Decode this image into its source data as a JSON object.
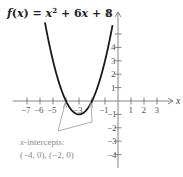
{
  "chart_data": {
    "type": "line",
    "function": "x^2 + 6x + 8",
    "xlabel": "x",
    "ylabel": "y",
    "xlim": [
      -8,
      4
    ],
    "ylim": [
      -5,
      6
    ],
    "x_ticks": [
      -7,
      -6,
      -5,
      -4,
      -3,
      -2,
      -1,
      1,
      2,
      3
    ],
    "x_tick_labels": [
      "−7",
      "−6",
      "−5",
      "",
      "−3",
      "",
      "−1",
      "1",
      "2",
      "3"
    ],
    "y_ticks": [
      5,
      4,
      3,
      2,
      1,
      -1,
      -2,
      -3,
      -4
    ],
    "y_tick_labels": [
      "",
      "4",
      "3",
      "2",
      "1",
      "−1",
      "−2",
      "−3",
      "−4"
    ],
    "points": [
      {
        "x": -5.6,
        "y": 5.76
      },
      {
        "x": -5,
        "y": 3
      },
      {
        "x": -4,
        "y": 0
      },
      {
        "x": -3,
        "y": -1
      },
      {
        "x": -2,
        "y": 0
      },
      {
        "x": -1,
        "y": 3
      },
      {
        "x": -0.4,
        "y": 5.76
      }
    ],
    "vertex": {
      "x": -3,
      "y": -1
    },
    "x_intercepts": [
      {
        "x": -4,
        "y": 0
      },
      {
        "x": -2,
        "y": 0
      }
    ],
    "annotation": {
      "line1": "x-intercepts:",
      "line2": "(−4, 0), (−2, 0)"
    },
    "grid": false,
    "colors": {
      "curve": "#1a1a1a",
      "axes": "#777777",
      "annotation": "#8a8a8a"
    }
  },
  "labels": {
    "x_axis": "x",
    "y_axis": "y",
    "annot_var": "x",
    "annot_rest": "-intercepts:",
    "annot_values": "(−4, 0), (−2, 0)"
  }
}
